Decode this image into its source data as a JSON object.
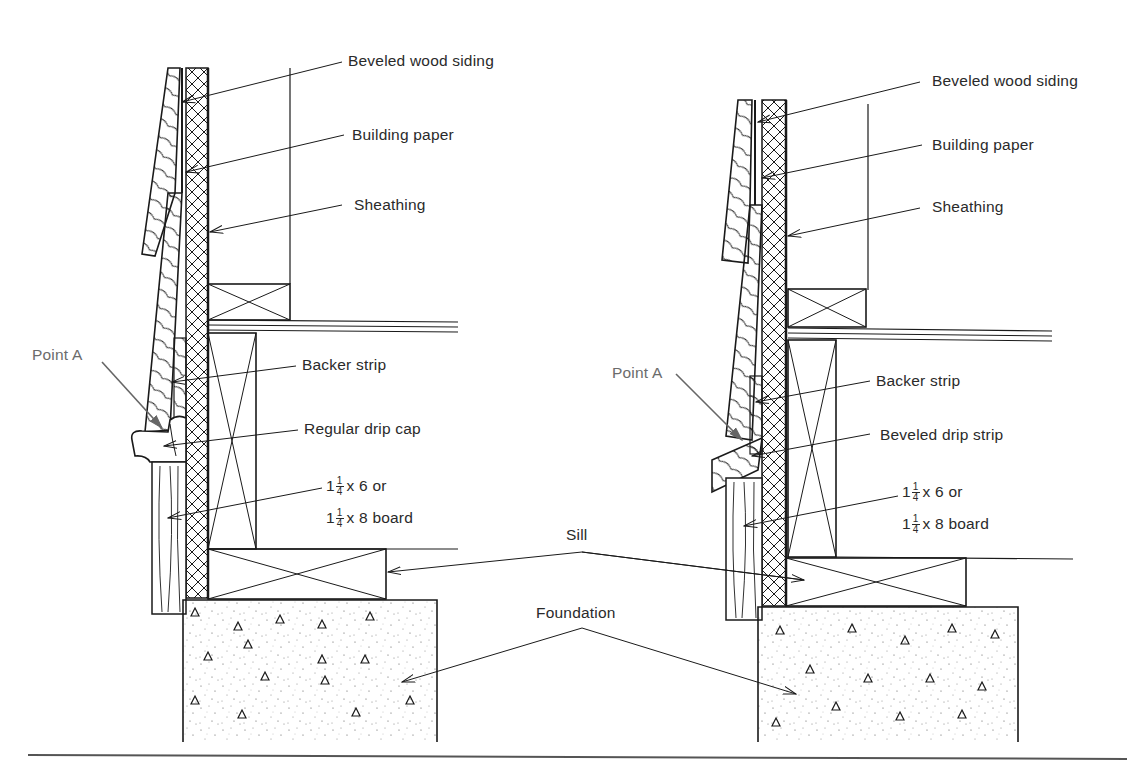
{
  "diagram": {
    "panels": [
      {
        "id": "left",
        "variant": "Regular drip cap",
        "labels": {
          "siding": "Beveled wood siding",
          "paper": "Building paper",
          "sheathing": "Sheathing",
          "point_a": "Point A",
          "backer": "Backer strip",
          "drip": "Regular drip cap",
          "board_line1_whole": "1",
          "board_line1_num": "1",
          "board_line1_den": "4",
          "board_line1_rest": "x 6 or",
          "board_line2_whole": "1",
          "board_line2_num": "1",
          "board_line2_den": "4",
          "board_line2_rest": "x 8  board"
        }
      },
      {
        "id": "right",
        "variant": "Beveled drip strip",
        "labels": {
          "siding": "Beveled wood siding",
          "paper": "Building paper",
          "sheathing": "Sheathing",
          "point_a": "Point A",
          "backer": "Backer strip",
          "drip": "Beveled drip strip",
          "board_line1_whole": "1",
          "board_line1_num": "1",
          "board_line1_den": "4",
          "board_line1_rest": "x 6 or",
          "board_line2_whole": "1",
          "board_line2_num": "1",
          "board_line2_den": "4",
          "board_line2_rest": "x 8  board"
        }
      }
    ],
    "shared_labels": {
      "sill": "Sill",
      "foundation": "Foundation"
    },
    "colors": {
      "ink": "#1a1a1a",
      "label_text": "#2a2a2a",
      "point_a_text": "#6b6b6b",
      "background": "#ffffff"
    }
  }
}
